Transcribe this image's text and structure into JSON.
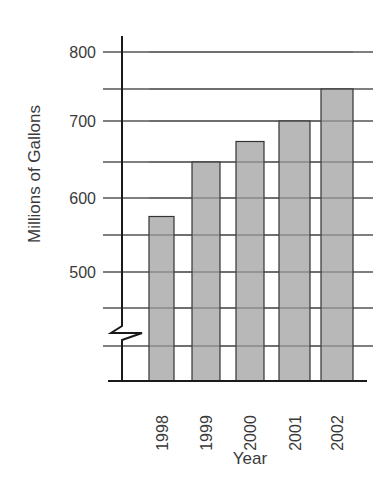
{
  "chart_data": {
    "type": "bar",
    "title": "",
    "xlabel": "Year",
    "ylabel": "Millions of Gallons",
    "categories": [
      "1998",
      "1999",
      "2000",
      "2001",
      "2002"
    ],
    "values": [
      575,
      650,
      675,
      700,
      750
    ],
    "ylim": [
      400,
      800
    ],
    "y_ticks_labeled": [
      500,
      600,
      700,
      800
    ],
    "gridlines": [
      400,
      450,
      500,
      550,
      600,
      650,
      700,
      750,
      800
    ],
    "axis_break": true,
    "grid": true,
    "legend": null,
    "colors": {
      "bar_fill": "#b8b8b8",
      "bar_stroke": "#333333",
      "grid": "#555555",
      "axis": "#1a1a1a"
    }
  },
  "layout": {
    "grid_px": {
      "800": 52,
      "750": 89,
      "700": 121,
      "650": 162,
      "600": 198,
      "550": 235,
      "500": 272,
      "450": 308,
      "400": 346
    },
    "baseline_y": 381,
    "bars_x": [
      [
        149,
        174
      ],
      [
        192,
        220
      ],
      [
        236,
        264
      ],
      [
        279,
        310
      ],
      [
        321,
        353
      ]
    ]
  }
}
